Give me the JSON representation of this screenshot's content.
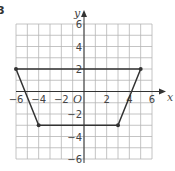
{
  "question_number": "3",
  "chart_data": {
    "type": "line",
    "title": "",
    "xlabel": "x",
    "ylabel": "y",
    "origin_label": "O",
    "xlim": [
      -6,
      6
    ],
    "ylim": [
      -6,
      6
    ],
    "grid": true,
    "grid_step": 1,
    "x_ticks": [
      "-6",
      "-4",
      "-2",
      "2",
      "4",
      "6"
    ],
    "y_ticks": [
      "6",
      "4",
      "2",
      "-2",
      "-4",
      "-6"
    ],
    "series": [
      {
        "name": "trapezium",
        "closed": true,
        "points": [
          [
            -6,
            2
          ],
          [
            5,
            2
          ],
          [
            3,
            -3
          ],
          [
            -4,
            -3
          ]
        ]
      }
    ]
  },
  "colors": {
    "grid": "#b5b5b5",
    "axis": "#333333",
    "shape": "#333333"
  }
}
